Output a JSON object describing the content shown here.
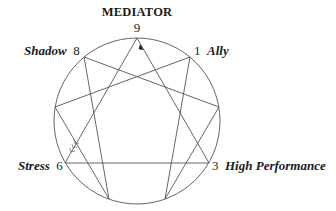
{
  "diagram": {
    "type": "enneagram",
    "title": "MEDIATOR",
    "center": [
      137,
      121
    ],
    "radius": 83,
    "stroke_color": "#555555",
    "points": [
      {
        "id": 9,
        "x": 137,
        "y": 38
      },
      {
        "id": 1,
        "x": 190,
        "y": 57
      },
      {
        "id": 2,
        "x": 219,
        "y": 107
      },
      {
        "id": 3,
        "x": 209,
        "y": 163
      },
      {
        "id": 4,
        "x": 165,
        "y": 199
      },
      {
        "id": 5,
        "x": 109,
        "y": 199
      },
      {
        "id": 6,
        "x": 65,
        "y": 163
      },
      {
        "id": 7,
        "x": 55,
        "y": 107
      },
      {
        "id": 8,
        "x": 84,
        "y": 57
      }
    ],
    "connections": [
      [
        9,
        3
      ],
      [
        3,
        6
      ],
      [
        6,
        9
      ],
      [
        1,
        4
      ],
      [
        4,
        2
      ],
      [
        2,
        8
      ],
      [
        8,
        5
      ],
      [
        5,
        7
      ],
      [
        7,
        1
      ]
    ],
    "arrow_head": {
      "on": [
        3,
        9
      ],
      "points_to": 9
    },
    "arrow_tail": {
      "on": [
        6,
        9
      ],
      "near": 6
    },
    "labels": {
      "top_title": "MEDIATOR",
      "p9_num": "9",
      "p8_name": "Shadow",
      "p8_num": "8",
      "p1_num": "1",
      "p1_name": "Ally",
      "p6_name": "Stress",
      "p6_num": "6",
      "p3_num": "3",
      "p3_name": "High Performance"
    }
  }
}
